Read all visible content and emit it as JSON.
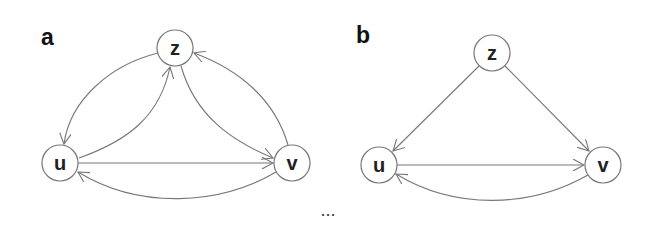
{
  "figure": {
    "ellipsis": "...",
    "colors": {
      "edge": "#777777",
      "node_stroke": "#777777",
      "label": "#222222",
      "background": "#ffffff"
    },
    "panels": [
      {
        "label": "a",
        "nodes": [
          {
            "id": "z",
            "label": "z",
            "cx": 175,
            "cy": 48
          },
          {
            "id": "u",
            "label": "u",
            "cx": 60,
            "cy": 163
          },
          {
            "id": "v",
            "label": "v",
            "cx": 292,
            "cy": 163
          }
        ],
        "edges": [
          {
            "from": "z",
            "to": "u",
            "style": "curved-outer"
          },
          {
            "from": "u",
            "to": "z",
            "style": "curved-inner"
          },
          {
            "from": "z",
            "to": "v",
            "style": "curved-inner"
          },
          {
            "from": "v",
            "to": "z",
            "style": "curved-outer"
          },
          {
            "from": "u",
            "to": "v",
            "style": "straight"
          },
          {
            "from": "v",
            "to": "u",
            "style": "curved-below"
          }
        ]
      },
      {
        "label": "b",
        "nodes": [
          {
            "id": "z",
            "label": "z",
            "cx": 492,
            "cy": 53
          },
          {
            "id": "u",
            "label": "u",
            "cx": 379,
            "cy": 165
          },
          {
            "id": "v",
            "label": "v",
            "cx": 603,
            "cy": 165
          }
        ],
        "edges": [
          {
            "from": "z",
            "to": "u",
            "style": "straight"
          },
          {
            "from": "z",
            "to": "v",
            "style": "straight"
          },
          {
            "from": "u",
            "to": "v",
            "style": "straight"
          },
          {
            "from": "v",
            "to": "u",
            "style": "curved-below"
          }
        ]
      }
    ]
  }
}
